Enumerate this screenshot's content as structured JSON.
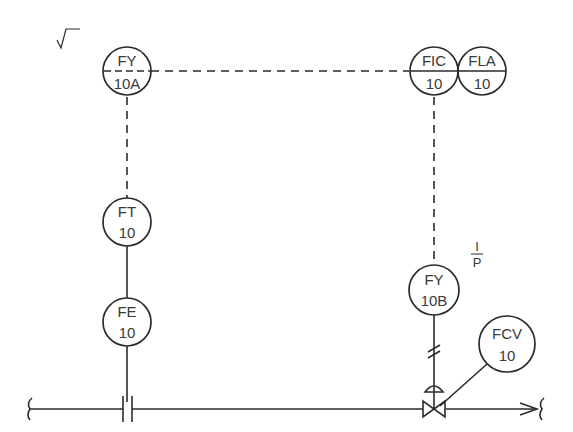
{
  "diagram": {
    "type": "P&ID flow control loop",
    "colors": {
      "line": "#2b2b2b",
      "text": "#3a3a3a",
      "background": "#ffffff"
    },
    "instruments": {
      "fy10a": {
        "function": "FY",
        "number": "10A",
        "annotation": "√",
        "note": "square root extractor"
      },
      "fic10": {
        "function": "FIC",
        "number": "10"
      },
      "fla10": {
        "function": "FLA",
        "number": "10"
      },
      "ft10": {
        "function": "FT",
        "number": "10"
      },
      "fe10": {
        "function": "FE",
        "number": "10"
      },
      "fy10b": {
        "function": "FY",
        "number": "10B",
        "annotation_top": "I",
        "annotation_bottom": "P"
      },
      "fcv10": {
        "function": "FCV",
        "number": "10"
      }
    },
    "signals": [
      {
        "from": "FY 10A",
        "to": "FIC 10",
        "type": "electrical (dashed)"
      },
      {
        "from": "FT 10",
        "to": "FY 10A",
        "type": "electrical (dashed)"
      },
      {
        "from": "FIC 10",
        "to": "FY 10B",
        "type": "electrical (dashed)"
      },
      {
        "from": "FE 10",
        "to": "FT 10",
        "type": "process connection"
      },
      {
        "from": "FY 10B",
        "to": "control valve",
        "type": "pneumatic (hash marks)"
      }
    ],
    "process_line": {
      "elements": [
        "orifice plate",
        "control valve with diaphragm actuator",
        "flow arrow"
      ]
    }
  }
}
